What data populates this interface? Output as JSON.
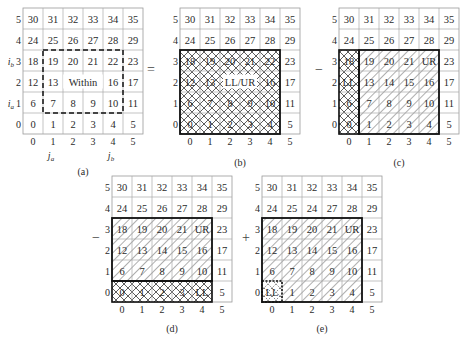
{
  "figure": {
    "grid_values": [
      [
        30,
        31,
        32,
        33,
        34,
        35
      ],
      [
        24,
        25,
        26,
        27,
        28,
        29
      ],
      [
        18,
        19,
        20,
        21,
        22,
        23
      ],
      [
        12,
        13,
        14,
        15,
        16,
        17
      ],
      [
        6,
        7,
        8,
        9,
        10,
        11
      ],
      [
        0,
        1,
        2,
        3,
        4,
        5
      ]
    ],
    "row_labels": [
      "5",
      "4",
      "3",
      "2",
      "1",
      "0"
    ],
    "col_labels": [
      "0",
      "1",
      "2",
      "3",
      "4",
      "5"
    ],
    "operators": [
      "=",
      "−",
      "−",
      "+"
    ],
    "panels": [
      {
        "id": "a",
        "caption": "(a)",
        "row_labels": [
          "5",
          "4",
          "i_b 3",
          "2",
          "i_a 1",
          "0"
        ],
        "col_sublabels": [
          "",
          "j_a",
          "",
          "",
          "j_b",
          ""
        ],
        "region": {
          "label": "Within",
          "rows": [
            1,
            3
          ],
          "cols": [
            1,
            4
          ],
          "style": "dashed"
        },
        "overrides": {
          "2,2": "Within",
          "2,3": ""
        }
      },
      {
        "id": "b",
        "caption": "(b)",
        "hatched_region": {
          "rows": [
            0,
            3
          ],
          "cols": [
            0,
            4
          ],
          "pattern": "cross"
        },
        "overrides": {
          "2,2": "LL/UR",
          "2,3": ""
        }
      },
      {
        "id": "c",
        "caption": "(c)",
        "hatched_region": {
          "rows": [
            0,
            3
          ],
          "cols": [
            1,
            4
          ],
          "pattern": "diagonal"
        },
        "cross_region": {
          "rows": [
            0,
            3
          ],
          "cols": [
            0,
            0
          ],
          "pattern": "cross"
        },
        "overrides": {
          "3,4": "UR",
          "2,0": "LL"
        }
      },
      {
        "id": "d",
        "caption": "(d)",
        "hatched_region": {
          "rows": [
            1,
            3
          ],
          "cols": [
            0,
            4
          ],
          "pattern": "diagonal"
        },
        "cross_region": {
          "rows": [
            0,
            0
          ],
          "cols": [
            0,
            4
          ],
          "pattern": "cross"
        },
        "overrides": {
          "3,4": "UR",
          "0,4": "LL"
        }
      },
      {
        "id": "e",
        "caption": "(e)",
        "hatched_region": {
          "rows": [
            0,
            3
          ],
          "cols": [
            0,
            4
          ],
          "pattern": "diagonal"
        },
        "cross_region": {
          "rows": [
            0,
            0
          ],
          "cols": [
            0,
            0
          ],
          "pattern": "dotted-cross"
        },
        "overrides": {
          "3,4": "UR",
          "0,0": "LL",
          "4,2": "24"
        }
      }
    ]
  }
}
